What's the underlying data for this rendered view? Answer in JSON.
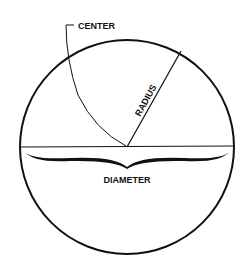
{
  "diagram": {
    "labels": {
      "center": "CENTER",
      "radius": "RADIUS",
      "diameter": "DIAMETER"
    },
    "colors": {
      "stroke": "#111111",
      "background": "#ffffff"
    }
  }
}
